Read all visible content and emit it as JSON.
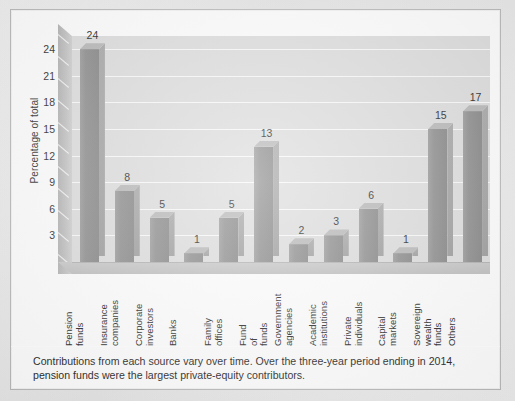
{
  "chart_data": {
    "type": "bar",
    "title": "",
    "subtitle": "",
    "xlabel": "",
    "ylabel": "Percentage of total",
    "ylim": [
      0,
      25.5
    ],
    "grid": true,
    "legend": "none",
    "yticks": [
      3,
      6,
      9,
      12,
      15,
      18,
      21,
      24
    ],
    "categories": [
      "Pension funds",
      "Insurance companies",
      "Corporate investors",
      "Banks",
      "Family offices",
      "Fund of funds",
      "Government agencies",
      "Academic institutions",
      "Private individuals",
      "Capital markets",
      "Sovereign wealth funds",
      "Others"
    ],
    "values": [
      24,
      8,
      5,
      1,
      5,
      13,
      2,
      3,
      6,
      1,
      15,
      17
    ],
    "bar_color": "#8a8a8a",
    "plot_background": "#dcdcdc",
    "annotation": "Contributions from each source vary over time. Over the three-year period ending in 2014, pension funds were the largest private-equity contributors."
  },
  "caption": {
    "text": "Contributions from each source vary over time. Over the three-year period ending in 2014, pension funds were the largest private-equity contributors."
  }
}
